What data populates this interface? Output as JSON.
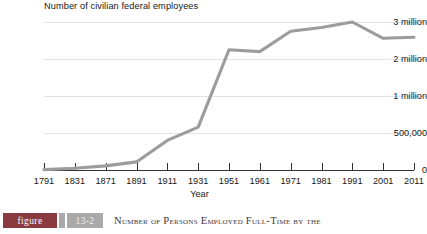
{
  "chart_data": {
    "type": "line",
    "title": "",
    "ylabel": "Number of civilian federal employees",
    "xlabel": "Year",
    "grid": true,
    "legend": "none",
    "axis_note": "y-axis is non-linear: equal pixel spacing between 0, 500,000, 1 million, 2 million, 3 million",
    "ytick_labels": [
      "0",
      "500,000",
      "1 million",
      "2 million",
      "3 million"
    ],
    "ytick_values": [
      0,
      500000,
      1000000,
      2000000,
      3000000
    ],
    "categories": [
      "1791",
      "1831",
      "1871",
      "1891",
      "1911",
      "1931",
      "1951",
      "1961",
      "1971",
      "1981",
      "1991",
      "2001",
      "2011"
    ],
    "x": [
      1791,
      1831,
      1871,
      1891,
      1911,
      1931,
      1951,
      1961,
      1971,
      1981,
      1991,
      2001,
      2011
    ],
    "values": [
      5000,
      25000,
      55000,
      110000,
      400000,
      580000,
      2250000,
      2200000,
      2750000,
      2850000,
      3000000,
      2560000,
      2590000
    ],
    "line_color": "#9c9c9c",
    "grid_color": "#e3e3e3",
    "axis_color": "#333333"
  },
  "caption": {
    "badge_label": "figure",
    "number": "13-2",
    "text": "Number of Persons Employed Full-Time by the",
    "badge_color": "#8a3a3f",
    "number_badge_color": "#a9a9a9"
  }
}
